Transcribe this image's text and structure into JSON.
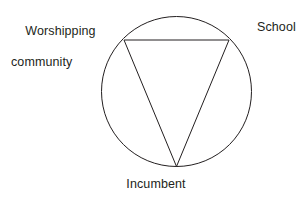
{
  "diagram": {
    "type": "triangle-in-circle",
    "title": "",
    "background_color": "#ffffff",
    "stroke_color": "#231f20",
    "stroke_width": 1,
    "text_color": "#231f20",
    "circle": {
      "center_x": 176.5,
      "center_y": 91.5,
      "radius": 75.0
    },
    "triangle": {
      "orientation": "inverted",
      "vertices": [
        {
          "id": "worshipping-community",
          "x": 124,
          "y": 40
        },
        {
          "id": "school",
          "x": 229,
          "y": 40
        },
        {
          "id": "incumbent",
          "x": 176.5,
          "y": 166.5
        }
      ]
    },
    "labels": {
      "worshipping_community_line1": "Worshipping",
      "worshipping_community_line2": "community",
      "school": "School",
      "incumbent": "Incumbent"
    }
  }
}
